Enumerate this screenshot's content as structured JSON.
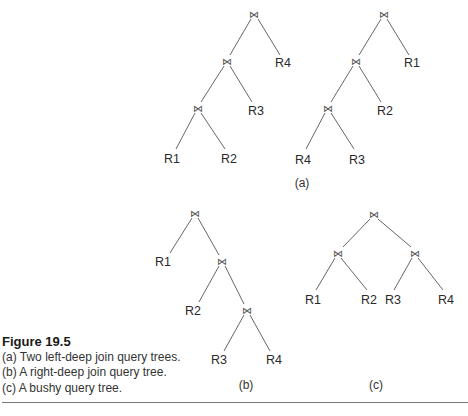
{
  "join_symbol": "⋈",
  "figure": {
    "title": "Figure 19.5",
    "lines": [
      "(a) Two left-deep join query trees.",
      "(b) A right-deep join query tree.",
      "(c) A bushy query tree."
    ]
  },
  "panels": {
    "a": {
      "label": "(a)",
      "tree1": {
        "leaves": [
          "R1",
          "R2",
          "R3",
          "R4"
        ]
      },
      "tree2": {
        "leaves": [
          "R4",
          "R3",
          "R2",
          "R1"
        ]
      }
    },
    "b": {
      "label": "(b)",
      "leaves": [
        "R1",
        "R2",
        "R3",
        "R4"
      ]
    },
    "c": {
      "label": "(c)",
      "leaves": [
        "R1",
        "R2",
        "R3",
        "R4"
      ]
    }
  }
}
